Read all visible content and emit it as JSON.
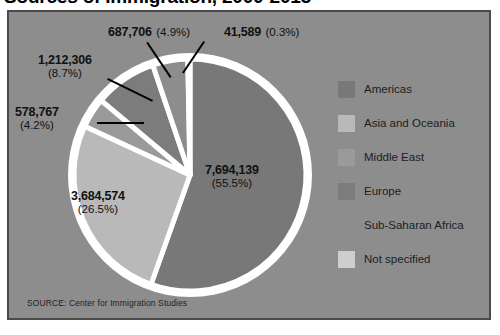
{
  "title": "Sources of Immigration, 2000-2013",
  "source_note": "SOURCE: Center for Immigration Studies",
  "legend": {
    "items": [
      {
        "label": "Americas",
        "color": "#787878"
      },
      {
        "label": "Asia and Oceania",
        "color": "#b9b9b9"
      },
      {
        "label": "Middle East",
        "color": "#9a9a9a"
      },
      {
        "label": "Europe",
        "color": "#7c7c7c"
      },
      {
        "label": "Sub-Saharan Africa",
        "color": "#8d8d8d"
      },
      {
        "label": "Not specified",
        "color": "#cecece"
      }
    ]
  },
  "labels": [
    {
      "num": "7,694,139",
      "pct": "(55.5%)"
    },
    {
      "num": "3,684,574",
      "pct": "(26.5%)"
    },
    {
      "num": "578,767",
      "pct": "(4.2%)"
    },
    {
      "num": "1,212,306",
      "pct": "(8.7%)"
    },
    {
      "num": "687,706",
      "pct": "(4.9%)"
    },
    {
      "num": "41,589",
      "pct": "(0.3%)"
    }
  ],
  "chart_data": {
    "type": "pie",
    "title": "Sources of Immigration, 2000-2013",
    "xlabel": "",
    "ylabel": "",
    "legend_position": "right",
    "grid": false,
    "total": 13899081,
    "start_angle_deg": 0,
    "direction": "clockwise",
    "slice_separator_color": "#ffffff",
    "panel_background": "#8d8d8d",
    "categories": [
      "Americas",
      "Asia and Oceania",
      "Middle East",
      "Europe",
      "Sub-Saharan Africa",
      "Not specified"
    ],
    "values": [
      7694139,
      3684574,
      578767,
      1212306,
      687706,
      41589
    ],
    "percents": [
      55.5,
      26.5,
      4.2,
      8.7,
      4.9,
      0.3
    ],
    "value_labels": [
      "7,694,139",
      "3,684,574",
      "578,767",
      "1,212,306",
      "687,706",
      "41,589"
    ],
    "percent_labels": [
      "(55.5%)",
      "(26.5%)",
      "(4.2%)",
      "(8.7%)",
      "(4.9%)",
      "(0.3%)"
    ],
    "colors": [
      "#787878",
      "#b9b9b9",
      "#9a9a9a",
      "#7c7c7c",
      "#8d8d8d",
      "#cecece"
    ],
    "source": "Center for Immigration Studies"
  }
}
